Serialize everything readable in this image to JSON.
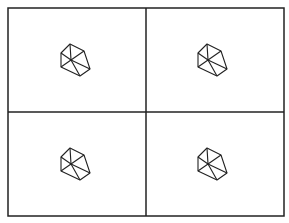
{
  "diagram": {
    "type": "2x2-grid-of-polyhedron-icons",
    "background_color": "#ffffff",
    "line_color": "#222222",
    "frame": {
      "x": 8,
      "y": 8,
      "width": 276,
      "height": 208
    },
    "dividers": {
      "vertical_x": 146,
      "horizontal_y": 112
    },
    "cells": [
      {
        "id": "top-left",
        "dx": 0,
        "dy": 0
      },
      {
        "id": "top-right",
        "dx": 137,
        "dy": 0
      },
      {
        "id": "bottom-left",
        "dx": 0,
        "dy": 104
      },
      {
        "id": "bottom-right",
        "dx": 137,
        "dy": 104
      }
    ],
    "shape": {
      "name": "polyhedron-wireframe-icon",
      "outline": [
        [
          70,
          44
        ],
        [
          84,
          51
        ],
        [
          90,
          69
        ],
        [
          80,
          76
        ],
        [
          61,
          67
        ],
        [
          61,
          53
        ]
      ],
      "center": [
        71,
        60
      ],
      "spokes_to": [
        [
          70,
          44
        ],
        [
          84,
          51
        ],
        [
          61,
          53
        ],
        [
          61,
          67
        ],
        [
          80,
          76
        ],
        [
          90,
          69
        ]
      ]
    }
  }
}
